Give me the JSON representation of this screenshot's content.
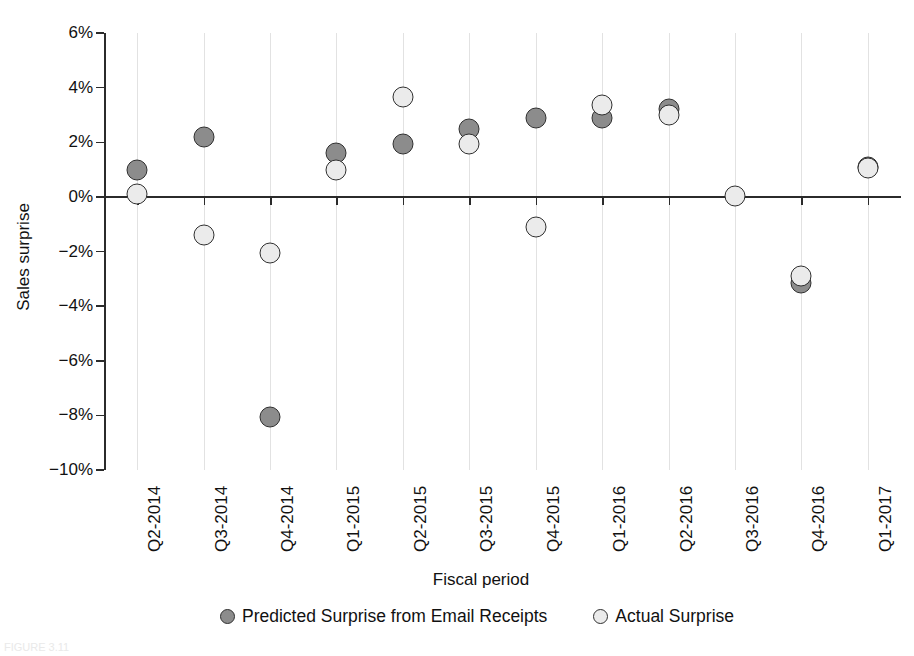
{
  "chart_data": {
    "type": "scatter",
    "title": "",
    "xlabel": "Fiscal period",
    "ylabel": "Sales surprise",
    "categories": [
      "Q2-2014",
      "Q3-2014",
      "Q4-2014",
      "Q1-2015",
      "Q2-2015",
      "Q3-2015",
      "Q4-2015",
      "Q1-2016",
      "Q2-2016",
      "Q3-2016",
      "Q4-2016",
      "Q1-2017"
    ],
    "ylim": [
      -10,
      6
    ],
    "yticks": [
      6,
      4,
      2,
      0,
      -2,
      -4,
      -6,
      -8,
      -10
    ],
    "ytick_labels": [
      "6%",
      "4%",
      "2%",
      "0%",
      "−2%",
      "−4%",
      "−6%",
      "−8%",
      "−10%"
    ],
    "grid": "vertical-only",
    "legend_position": "bottom",
    "series": [
      {
        "name": "Predicted Surprise from Email Receipts",
        "color": "#8c8c8c",
        "values": [
          1.0,
          2.2,
          -8.05,
          1.6,
          1.95,
          2.5,
          2.9,
          2.9,
          3.2,
          null,
          -3.15,
          1.1
        ]
      },
      {
        "name": "Actual Surprise",
        "color": "#ebebeb",
        "values": [
          0.1,
          -1.4,
          -2.05,
          1.0,
          3.65,
          1.95,
          -1.1,
          3.35,
          3.0,
          0.05,
          -2.9,
          1.05
        ]
      }
    ]
  },
  "figure": {
    "caption": "FIGURE 3.11"
  },
  "legend": {
    "items": [
      {
        "label": "Predicted Surprise from Email Receipts",
        "color": "#8c8c8c"
      },
      {
        "label": "Actual Surprise",
        "color": "#ebebeb"
      }
    ]
  }
}
